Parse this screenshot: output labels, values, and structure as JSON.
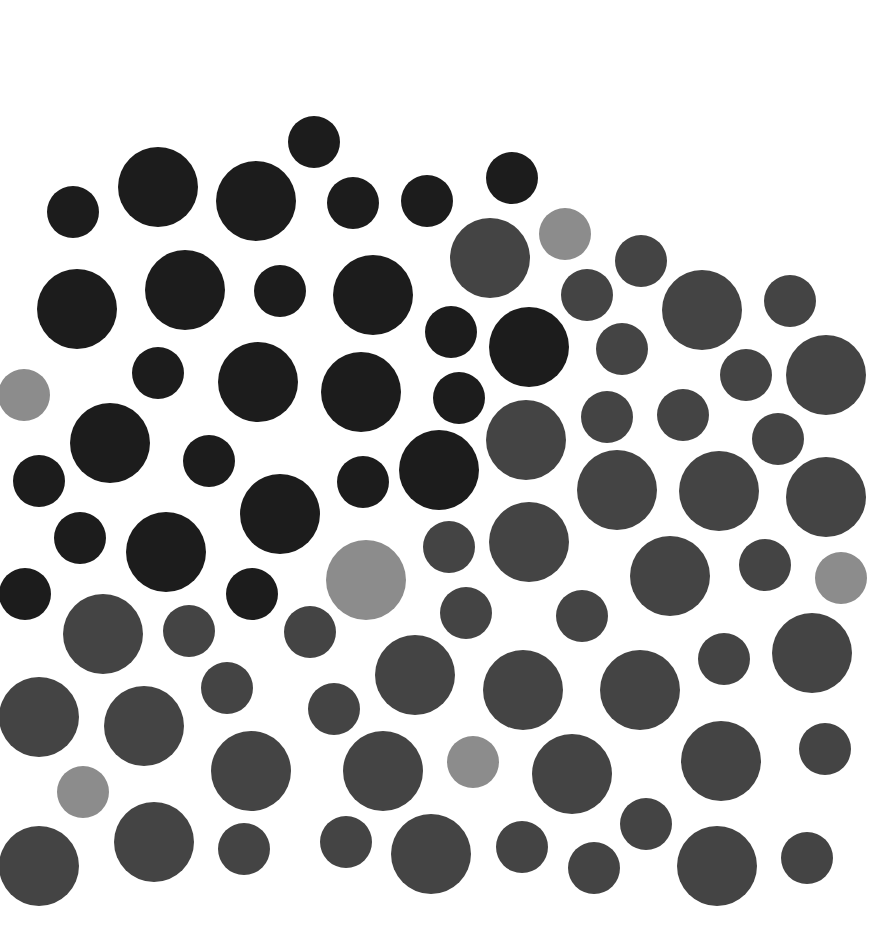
{
  "pattern": {
    "background": "#ffffff",
    "colors": {
      "black": "#1c1c1c",
      "dark": "#444444",
      "light": "#8c8c8c"
    },
    "dots": [
      {
        "x": 314,
        "y": 142,
        "d": 52,
        "c": "black"
      },
      {
        "x": 73,
        "y": 212,
        "d": 52,
        "c": "black"
      },
      {
        "x": 158,
        "y": 187,
        "d": 80,
        "c": "black"
      },
      {
        "x": 256,
        "y": 201,
        "d": 80,
        "c": "black"
      },
      {
        "x": 353,
        "y": 203,
        "d": 52,
        "c": "black"
      },
      {
        "x": 427,
        "y": 201,
        "d": 52,
        "c": "black"
      },
      {
        "x": 512,
        "y": 178,
        "d": 52,
        "c": "black"
      },
      {
        "x": 490,
        "y": 258,
        "d": 80,
        "c": "dark"
      },
      {
        "x": 565,
        "y": 234,
        "d": 52,
        "c": "light"
      },
      {
        "x": 641,
        "y": 261,
        "d": 52,
        "c": "dark"
      },
      {
        "x": 587,
        "y": 295,
        "d": 52,
        "c": "dark"
      },
      {
        "x": 702,
        "y": 310,
        "d": 80,
        "c": "dark"
      },
      {
        "x": 790,
        "y": 301,
        "d": 52,
        "c": "dark"
      },
      {
        "x": 77,
        "y": 309,
        "d": 80,
        "c": "black"
      },
      {
        "x": 185,
        "y": 290,
        "d": 80,
        "c": "black"
      },
      {
        "x": 280,
        "y": 291,
        "d": 52,
        "c": "black"
      },
      {
        "x": 373,
        "y": 295,
        "d": 80,
        "c": "black"
      },
      {
        "x": 451,
        "y": 332,
        "d": 52,
        "c": "black"
      },
      {
        "x": 529,
        "y": 347,
        "d": 80,
        "c": "black"
      },
      {
        "x": 622,
        "y": 349,
        "d": 52,
        "c": "dark"
      },
      {
        "x": 746,
        "y": 375,
        "d": 52,
        "c": "dark"
      },
      {
        "x": 826,
        "y": 375,
        "d": 80,
        "c": "dark"
      },
      {
        "x": 24,
        "y": 395,
        "d": 52,
        "c": "light"
      },
      {
        "x": 158,
        "y": 373,
        "d": 52,
        "c": "black"
      },
      {
        "x": 258,
        "y": 382,
        "d": 80,
        "c": "black"
      },
      {
        "x": 361,
        "y": 392,
        "d": 80,
        "c": "black"
      },
      {
        "x": 459,
        "y": 398,
        "d": 52,
        "c": "black"
      },
      {
        "x": 526,
        "y": 440,
        "d": 80,
        "c": "dark"
      },
      {
        "x": 607,
        "y": 417,
        "d": 52,
        "c": "dark"
      },
      {
        "x": 683,
        "y": 415,
        "d": 52,
        "c": "dark"
      },
      {
        "x": 778,
        "y": 439,
        "d": 52,
        "c": "dark"
      },
      {
        "x": 110,
        "y": 443,
        "d": 80,
        "c": "black"
      },
      {
        "x": 39,
        "y": 481,
        "d": 52,
        "c": "black"
      },
      {
        "x": 209,
        "y": 461,
        "d": 52,
        "c": "black"
      },
      {
        "x": 280,
        "y": 514,
        "d": 80,
        "c": "black"
      },
      {
        "x": 363,
        "y": 482,
        "d": 52,
        "c": "black"
      },
      {
        "x": 439,
        "y": 470,
        "d": 80,
        "c": "black"
      },
      {
        "x": 617,
        "y": 490,
        "d": 80,
        "c": "dark"
      },
      {
        "x": 719,
        "y": 491,
        "d": 80,
        "c": "dark"
      },
      {
        "x": 826,
        "y": 497,
        "d": 80,
        "c": "dark"
      },
      {
        "x": 80,
        "y": 538,
        "d": 52,
        "c": "black"
      },
      {
        "x": 166,
        "y": 552,
        "d": 80,
        "c": "black"
      },
      {
        "x": 449,
        "y": 547,
        "d": 52,
        "c": "dark"
      },
      {
        "x": 529,
        "y": 542,
        "d": 80,
        "c": "dark"
      },
      {
        "x": 25,
        "y": 594,
        "d": 52,
        "c": "black"
      },
      {
        "x": 252,
        "y": 594,
        "d": 52,
        "c": "black"
      },
      {
        "x": 366,
        "y": 580,
        "d": 80,
        "c": "light"
      },
      {
        "x": 670,
        "y": 576,
        "d": 80,
        "c": "dark"
      },
      {
        "x": 765,
        "y": 565,
        "d": 52,
        "c": "dark"
      },
      {
        "x": 841,
        "y": 578,
        "d": 52,
        "c": "light"
      },
      {
        "x": 103,
        "y": 634,
        "d": 80,
        "c": "dark"
      },
      {
        "x": 189,
        "y": 631,
        "d": 52,
        "c": "dark"
      },
      {
        "x": 310,
        "y": 632,
        "d": 52,
        "c": "dark"
      },
      {
        "x": 466,
        "y": 613,
        "d": 52,
        "c": "dark"
      },
      {
        "x": 582,
        "y": 616,
        "d": 52,
        "c": "dark"
      },
      {
        "x": 812,
        "y": 653,
        "d": 80,
        "c": "dark"
      },
      {
        "x": 724,
        "y": 659,
        "d": 52,
        "c": "dark"
      },
      {
        "x": 39,
        "y": 717,
        "d": 80,
        "c": "dark"
      },
      {
        "x": 144,
        "y": 726,
        "d": 80,
        "c": "dark"
      },
      {
        "x": 227,
        "y": 688,
        "d": 52,
        "c": "dark"
      },
      {
        "x": 334,
        "y": 709,
        "d": 52,
        "c": "dark"
      },
      {
        "x": 415,
        "y": 675,
        "d": 80,
        "c": "dark"
      },
      {
        "x": 523,
        "y": 690,
        "d": 80,
        "c": "dark"
      },
      {
        "x": 640,
        "y": 690,
        "d": 80,
        "c": "dark"
      },
      {
        "x": 251,
        "y": 771,
        "d": 80,
        "c": "dark"
      },
      {
        "x": 383,
        "y": 771,
        "d": 80,
        "c": "dark"
      },
      {
        "x": 473,
        "y": 762,
        "d": 52,
        "c": "light"
      },
      {
        "x": 572,
        "y": 774,
        "d": 80,
        "c": "dark"
      },
      {
        "x": 721,
        "y": 761,
        "d": 80,
        "c": "dark"
      },
      {
        "x": 825,
        "y": 749,
        "d": 52,
        "c": "dark"
      },
      {
        "x": 83,
        "y": 792,
        "d": 52,
        "c": "light"
      },
      {
        "x": 39,
        "y": 866,
        "d": 80,
        "c": "dark"
      },
      {
        "x": 154,
        "y": 842,
        "d": 80,
        "c": "dark"
      },
      {
        "x": 244,
        "y": 849,
        "d": 52,
        "c": "dark"
      },
      {
        "x": 346,
        "y": 842,
        "d": 52,
        "c": "dark"
      },
      {
        "x": 431,
        "y": 854,
        "d": 80,
        "c": "dark"
      },
      {
        "x": 522,
        "y": 847,
        "d": 52,
        "c": "dark"
      },
      {
        "x": 594,
        "y": 868,
        "d": 52,
        "c": "dark"
      },
      {
        "x": 646,
        "y": 824,
        "d": 52,
        "c": "dark"
      },
      {
        "x": 717,
        "y": 866,
        "d": 80,
        "c": "dark"
      },
      {
        "x": 807,
        "y": 858,
        "d": 52,
        "c": "dark"
      }
    ]
  }
}
